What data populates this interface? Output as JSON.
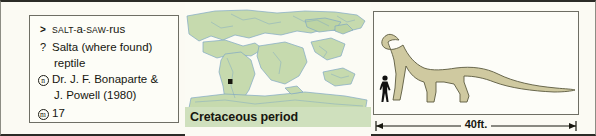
{
  "entry": {
    "facts": [
      {
        "key_icon": "greater-than-symbol",
        "key_label": ">",
        "label": "pronunciation",
        "value": "SALT-a-SAW-rus",
        "value_parts": [
          {
            "text": "SALT",
            "style": "small"
          },
          {
            "text": "-",
            "style": "small"
          },
          {
            "text": "a",
            "style": "big"
          },
          {
            "text": "-",
            "style": "small"
          },
          {
            "text": "SAW",
            "style": "small"
          },
          {
            "text": "-",
            "style": "small"
          },
          {
            "text": "rus",
            "style": "big"
          }
        ]
      },
      {
        "key_icon": "question-mark-symbol",
        "key_label": "?",
        "label": "meaning",
        "value": "Salta (where found)",
        "value_line2": "reptile"
      },
      {
        "key_icon": "circled-n-symbol",
        "key_label": "n",
        "label": "named-by",
        "value": "Dr. J. F. Bonaparte &",
        "value_line2": "J. Powell (1980)"
      },
      {
        "key_icon": "circled-m-symbol",
        "key_label": "m",
        "label": "entry-number",
        "value": "17"
      }
    ]
  },
  "map": {
    "caption": "Cretaceous period",
    "marker_label": "fossil-find-location",
    "land_color": "#c6daae",
    "coast_color": "#7fa8c4",
    "band_color": "#cfe0bd"
  },
  "size": {
    "scale_label": "40ft.",
    "dinosaur_color": "#cfc9a0",
    "human_color": "#111111"
  }
}
